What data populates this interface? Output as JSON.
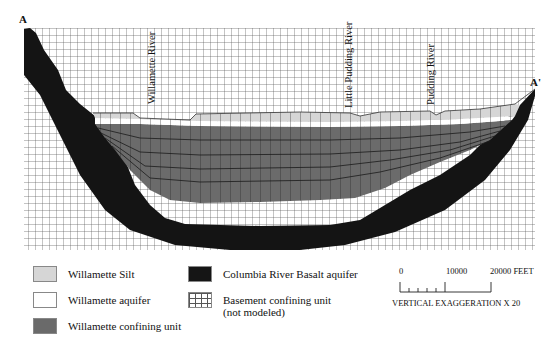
{
  "section": {
    "start_label": "A",
    "end_label": "A'",
    "rivers": [
      {
        "name": "Willamette River"
      },
      {
        "name": "Little Pudding River"
      },
      {
        "name": "Pudding River"
      }
    ]
  },
  "legend": {
    "items": [
      {
        "label": "Willamette Silt",
        "color": "#d8d8d8"
      },
      {
        "label": "Willamette aquifer",
        "color": "#ffffff"
      },
      {
        "label": "Willamette confining unit",
        "color": "#6a6a6a"
      },
      {
        "label": "Columbia River Basalt aquifer",
        "color": "#151515"
      },
      {
        "label": "Basement confining unit",
        "label2": "(not modeled)",
        "color": "grid"
      }
    ]
  },
  "scale": {
    "tick_0": "0",
    "tick_1": "10000",
    "tick_2": "20000 FEET",
    "note": "VERTICAL EXAGGERATION X 20"
  }
}
